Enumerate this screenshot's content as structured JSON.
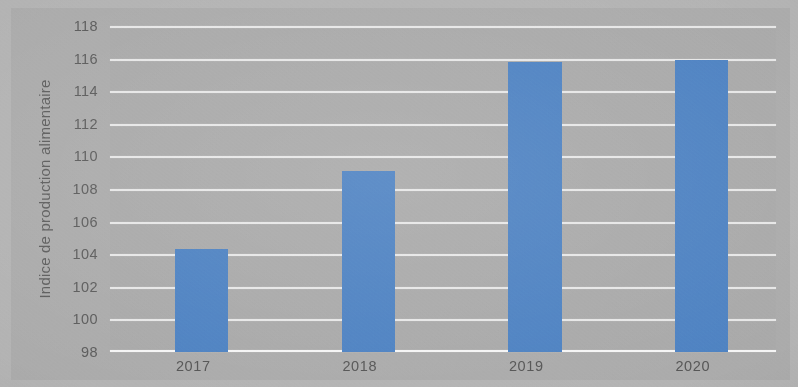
{
  "chart_data": {
    "type": "bar",
    "title": "",
    "subtitle": "",
    "xlabel": "",
    "ylabel": "Indice de production alimentaire",
    "categories": [
      "2017",
      "2018",
      "2019",
      "2020"
    ],
    "values": [
      104.3,
      109.1,
      115.8,
      115.9
    ],
    "series": [
      {
        "name": "Indice de production alimentaire",
        "values": [
          104.3,
          109.1,
          115.8,
          115.9
        ],
        "color": "#4e82c2"
      }
    ],
    "ylim": [
      98,
      118
    ],
    "yticks": [
      98,
      100,
      102,
      104,
      106,
      108,
      110,
      112,
      114,
      116,
      118
    ],
    "ytick_labels": [
      "98",
      "100",
      "102",
      "104",
      "106",
      "108",
      "110",
      "112",
      "114",
      "116",
      "118"
    ],
    "xtick_labels": [
      "2017",
      "2018",
      "2019",
      "2020"
    ],
    "grid": "horizontal",
    "legend": "none",
    "annotations": []
  },
  "style": {
    "bar_color": "#4e82c2",
    "gridline_color": "#ffffff",
    "plot_background": "#a9a9a9",
    "page_background": "#b3b3b3",
    "tick_text_color": "#5c5c5c",
    "axis_title_color": "#5e5e5e"
  }
}
